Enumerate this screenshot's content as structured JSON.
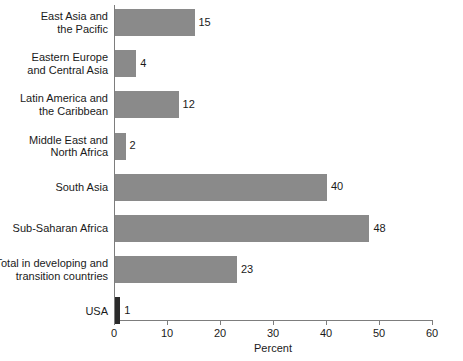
{
  "chart_data": {
    "type": "bar",
    "orientation": "horizontal",
    "title": "",
    "xlabel": "Percent",
    "ylabel": "",
    "xlim": [
      0,
      60
    ],
    "xticks": [
      0,
      10,
      20,
      30,
      40,
      50,
      60
    ],
    "xtick_labels": [
      "0",
      "10",
      "20",
      "30",
      "40",
      "50",
      "60"
    ],
    "grid": false,
    "legend": null,
    "categories": [
      "East Asia and\nthe Pacific",
      "Eastern Europe\nand Central Asia",
      "Latin America and\nthe Caribbean",
      "Middle East and\nNorth Africa",
      "South Asia",
      "Sub-Saharan Africa",
      "Total in developing and\ntransition countries",
      "USA"
    ],
    "values": [
      15,
      4,
      12,
      2,
      40,
      48,
      23,
      1
    ],
    "value_labels": [
      "15",
      "4",
      "12",
      "2",
      "40",
      "48",
      "23",
      "1"
    ],
    "bar_colors": [
      "#8a8a8a",
      "#8a8a8a",
      "#8a8a8a",
      "#8a8a8a",
      "#8a8a8a",
      "#8a8a8a",
      "#8a8a8a",
      "#2b2b2b"
    ]
  }
}
